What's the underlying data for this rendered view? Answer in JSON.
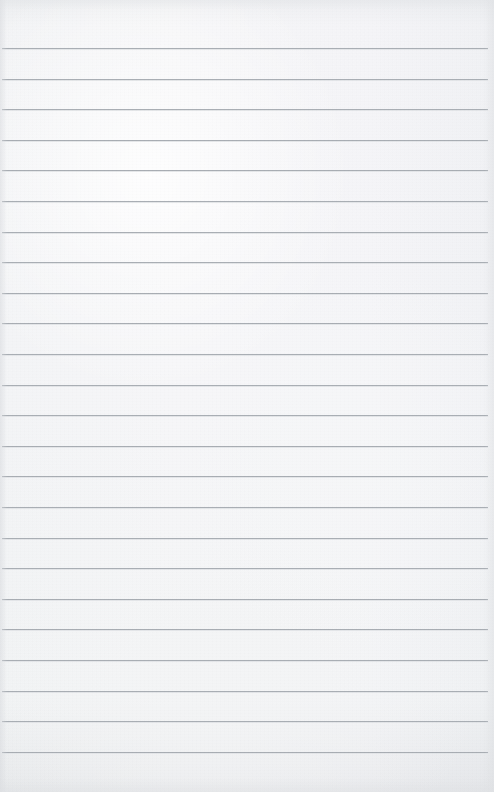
{
  "document": {
    "kind": "ruled-notebook-page",
    "title": "Blank ruled notebook page",
    "page_width": 494,
    "page_height": 792,
    "content_text": "",
    "paper_color": "#fbfbfc",
    "edge_tone_color": "#f2f3f4",
    "rule_color": "#a9aeb4",
    "rule_highlight_color": "#eceef0",
    "rule_thickness": 1,
    "rule_left_x": 2,
    "rule_right_x": 488,
    "rule_width": 486,
    "first_rule_y": 48,
    "rule_spacing": 30.6,
    "rule_count": 24,
    "top_margin": 48,
    "bottom_margin": 41,
    "rule_y_positions": [
      48,
      78.6,
      109.2,
      139.8,
      170.4,
      201,
      231.6,
      262.2,
      292.8,
      323.4,
      354,
      384.6,
      415.2,
      445.8,
      476.4,
      507,
      537.6,
      568.2,
      598.8,
      629.4,
      660,
      690.6,
      721.2,
      751.8
    ]
  }
}
